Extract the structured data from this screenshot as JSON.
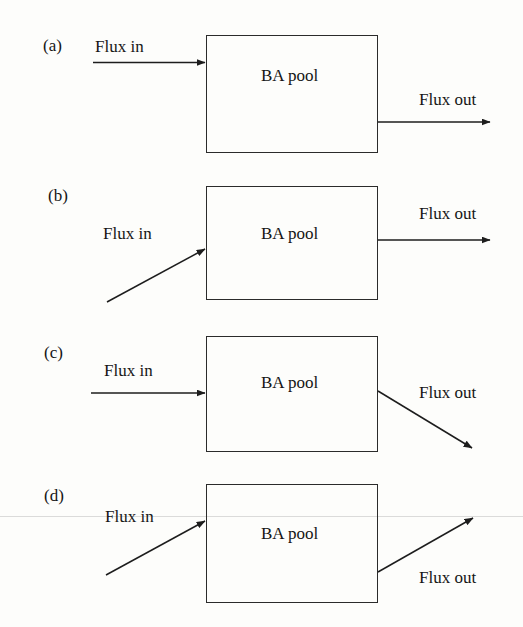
{
  "figure": {
    "background_color": "#fdfdfb",
    "stroke_color": "#2b2b2b",
    "text_color": "#151515",
    "panel_count": 4
  },
  "panels": [
    {
      "id": "a",
      "label": "(a)",
      "box_label": "BA pool",
      "inflow_label": "Flux in",
      "outflow_label": "Flux out",
      "inflow_style": "horizontal",
      "outflow_style": "horizontal"
    },
    {
      "id": "b",
      "label": "(b)",
      "box_label": "BA pool",
      "inflow_label": "Flux in",
      "outflow_label": "Flux out",
      "inflow_style": "diagonal-up",
      "outflow_style": "horizontal"
    },
    {
      "id": "c",
      "label": "(c)",
      "box_label": "BA pool",
      "inflow_label": "Flux in",
      "outflow_label": "Flux out",
      "inflow_style": "horizontal",
      "outflow_style": "diagonal-down"
    },
    {
      "id": "d",
      "label": "(d)",
      "box_label": "BA pool",
      "inflow_label": "Flux in",
      "outflow_label": "Flux out",
      "inflow_style": "diagonal-up",
      "outflow_style": "diagonal-up"
    }
  ]
}
